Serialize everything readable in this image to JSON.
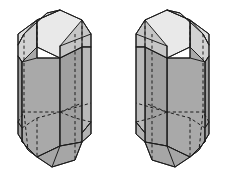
{
  "figure": {
    "background_color": "#ffffff",
    "line_color": "#1d1d1d",
    "canvas": {
      "width": 227,
      "height": 176
    }
  },
  "palette": {
    "face_top_light": "#e9e9e9",
    "face_top_lighter": "#efefef",
    "face_bevel_mid": "#c9c9c9",
    "face_front_gray": "#a9a9a9",
    "face_side_gray": "#9e9e9e",
    "face_side_dark": "#949494",
    "face_small_light": "#d8d8d8",
    "outline": "#1d1d1d"
  },
  "crystals": [
    {
      "name": "left-crystal",
      "handedness": "left",
      "faces": [
        {
          "id": "l-top-main",
          "label": "top-terminal-face",
          "fill": "#e9e9e9",
          "points": "37,20 60,10 82,20 82,47 60,58 37,47"
        },
        {
          "id": "l-top-left-bevel",
          "label": "upper-left-bevel-face",
          "fill": "#dcdcdc",
          "points": "37,20 60,10 47,13 24,34 18,45 18,34"
        },
        {
          "id": "l-top-left-lower-bevel",
          "label": "upper-left-lower-bevel",
          "fill": "#d2d2d2",
          "points": "18,45 24,34 37,20 37,47 22,62 18,56"
        },
        {
          "id": "l-left-face",
          "label": "left-prism-face",
          "fill": "#9e9e9e",
          "points": "18,56 22,62 22,128 18,122"
        },
        {
          "id": "l-front-left-face",
          "label": "front-left-prism-face",
          "fill": "#a9a9a9",
          "points": "22,62 37,47 37,58 60,58 60,146 37,157 22,142"
        },
        {
          "id": "l-front-right-face",
          "label": "front-right-prism-face",
          "fill": "#a0a0a0",
          "points": "60,58 82,47 82,142 60,146"
        },
        {
          "id": "l-right-bevel",
          "label": "right-upper-bevel-face",
          "fill": "#c6c6c6",
          "points": "82,20 91,34 91,47 82,47 60,58 60,46"
        },
        {
          "id": "l-right-face",
          "label": "right-prism-face",
          "fill": "#b9b9b9",
          "points": "82,47 91,47 91,122 82,133"
        },
        {
          "id": "l-bottom-left-bevel",
          "label": "lower-left-bevel-face",
          "fill": "#a4a4a4",
          "points": "22,128 22,142 37,157 28,150 18,134 18,122"
        },
        {
          "id": "l-bottom-face",
          "label": "bottom-terminal-face",
          "fill": "#a6a6a6",
          "points": "37,157 60,146 82,142 75,160 52,167"
        },
        {
          "id": "l-bottom-right-bevel",
          "label": "lower-right-bevel-face",
          "fill": "#b2b2b2",
          "points": "82,133 91,122 91,134 82,142"
        }
      ],
      "visible_edges": [
        "M 37,20 L 60,10 L 82,20 L 82,47 L 60,58 L 37,47 Z",
        "M 37,20 L 18,34 L 18,45 L 18,56 L 18,122 L 18,134 L 28,150 L 37,157",
        "M 60,10 L 47,13 L 24,34 L 18,45",
        "M 18,56 L 22,62 L 22,128 L 22,142 L 37,157",
        "M 22,62 L 37,47",
        "M 37,47 L 37,58 L 60,58 L 60,146 L 37,157",
        "M 37,58 L 22,62",
        "M 82,20 L 91,34 L 91,47 L 91,122 L 91,134 L 82,142",
        "M 82,47 L 91,47",
        "M 82,47 L 82,142",
        "M 60,46 L 91,34",
        "M 60,46 L 60,58",
        "M 37,157 L 52,167 L 75,160 L 82,142",
        "M 60,146 L 82,142",
        "M 60,146 L 52,167",
        "M 82,133 L 91,122"
      ],
      "hidden_edges": [
        "M 37,20 L 37,47",
        "M 82,20 L 82,47",
        "M 24,34 L 24,112 L 28,150",
        "M 75,34 L 75,118 L 75,160",
        "M 22,112 L 60,112 L 91,103",
        "M 60,112 L 75,118",
        "M 22,128 L 37,118 L 60,112",
        "M 37,118 L 37,157",
        "M 60,112 L 82,103",
        "M 18,122 L 24,112",
        "M 91,122 L 75,118"
      ]
    },
    {
      "name": "right-crystal",
      "handedness": "right",
      "faces": [
        {
          "id": "r-top-main",
          "label": "top-terminal-face",
          "fill": "#e9e9e9",
          "points": "145,20 167,10 190,20 190,47 167,58 145,47"
        },
        {
          "id": "r-top-right-bevel",
          "label": "upper-right-bevel-face",
          "fill": "#dcdcdc",
          "points": "190,20 167,10 180,13 203,34 209,45 209,34"
        },
        {
          "id": "r-top-right-lower-bevel",
          "label": "upper-right-lower-bevel",
          "fill": "#d2d2d2",
          "points": "209,45 203,34 190,20 190,47 205,62 209,56"
        },
        {
          "id": "r-right-face",
          "label": "right-prism-face",
          "fill": "#9e9e9e",
          "points": "209,56 205,62 205,128 209,122"
        },
        {
          "id": "r-front-right-face",
          "label": "front-right-prism-face",
          "fill": "#a9a9a9",
          "points": "205,62 190,47 190,58 167,58 167,146 190,157 205,142"
        },
        {
          "id": "r-front-left-face",
          "label": "front-left-prism-face",
          "fill": "#a0a0a0",
          "points": "167,58 145,47 145,142 167,146"
        },
        {
          "id": "r-left-bevel",
          "label": "left-upper-bevel-face",
          "fill": "#c6c6c6",
          "points": "145,20 136,34 136,47 145,47 167,58 167,46"
        },
        {
          "id": "r-left-face",
          "label": "left-prism-face",
          "fill": "#b9b9b9",
          "points": "145,47 136,47 136,122 145,133"
        },
        {
          "id": "r-bottom-right-bevel",
          "label": "lower-right-bevel-face",
          "fill": "#a4a4a4",
          "points": "205,128 205,142 190,157 199,150 209,134 209,122"
        },
        {
          "id": "r-bottom-face",
          "label": "bottom-terminal-face",
          "fill": "#a6a6a6",
          "points": "190,157 167,146 145,142 152,160 175,167"
        },
        {
          "id": "r-bottom-left-bevel",
          "label": "lower-left-bevel-face",
          "fill": "#b2b2b2",
          "points": "145,133 136,122 136,134 145,142"
        }
      ],
      "visible_edges": [
        "M 190,20 L 167,10 L 145,20 L 145,47 L 167,58 L 190,47 Z",
        "M 190,20 L 209,34 L 209,45 L 209,56 L 209,122 L 209,134 L 199,150 L 190,157",
        "M 167,10 L 180,13 L 203,34 L 209,45",
        "M 209,56 L 205,62 L 205,128 L 205,142 L 190,157",
        "M 205,62 L 190,47",
        "M 190,47 L 190,58 L 167,58 L 167,146 L 190,157",
        "M 190,58 L 205,62",
        "M 145,20 L 136,34 L 136,47 L 136,122 L 136,134 L 145,142",
        "M 145,47 L 136,47",
        "M 145,47 L 145,142",
        "M 167,46 L 136,34",
        "M 167,46 L 167,58",
        "M 190,157 L 175,167 L 152,160 L 145,142",
        "M 167,146 L 145,142",
        "M 167,146 L 175,167",
        "M 145,133 L 136,122"
      ],
      "hidden_edges": [
        "M 190,20 L 190,47",
        "M 145,20 L 145,47",
        "M 203,34 L 203,112 L 199,150",
        "M 152,34 L 152,118 L 152,160",
        "M 205,112 L 167,112 L 136,103",
        "M 167,112 L 152,118",
        "M 205,128 L 190,118 L 167,112",
        "M 190,118 L 190,157",
        "M 167,112 L 145,103",
        "M 209,122 L 203,112",
        "M 136,122 L 152,118"
      ]
    }
  ]
}
